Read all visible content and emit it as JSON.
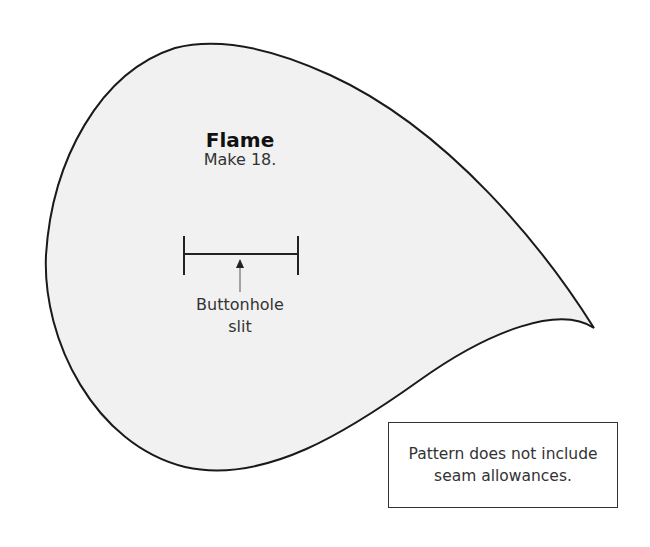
{
  "pattern_piece": {
    "name": "Flame",
    "instruction": "Make 18.",
    "fill_color": "#f1f1f1",
    "outline_color": "#1a1a1a"
  },
  "buttonhole": {
    "label_line1": "Buttonhole",
    "label_line2": "slit"
  },
  "note": {
    "line1": "Pattern does not include",
    "line2": "seam allowances."
  }
}
